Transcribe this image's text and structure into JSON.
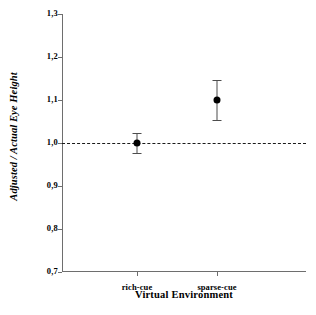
{
  "chart_data": {
    "type": "scatter",
    "title": "",
    "xlabel": "Virtual Environment",
    "ylabel": "Adjusted / Actual Eye Height",
    "categories": [
      "rich-cue",
      "sparse-cue"
    ],
    "values": [
      1.0,
      1.1
    ],
    "errors": [
      0.023,
      0.047
    ],
    "ylim": [
      0.7,
      1.3
    ],
    "ytick_values": [
      1.3,
      1.2,
      1.1,
      1.0,
      0.9,
      0.8,
      0.7
    ],
    "ytick_labels": [
      "1,3",
      "1,2",
      "1,1",
      "1,0",
      "0,9",
      "0,8",
      "0,7"
    ],
    "grid": false,
    "legend": false,
    "reference_line": {
      "value": 1.0,
      "style": "dashed",
      "color": "#1a1a1a"
    },
    "marker_color": "#000000",
    "errorbar_color": "#4d4d4d",
    "axis_color": "#6e6e6e",
    "points": [
      {
        "category": "rich-cue",
        "value": 1.0,
        "error": 0.023,
        "lower": 0.977,
        "upper": 1.023
      },
      {
        "category": "sparse-cue",
        "value": 1.1,
        "error": 0.047,
        "lower": 1.053,
        "upper": 1.147
      }
    ]
  }
}
